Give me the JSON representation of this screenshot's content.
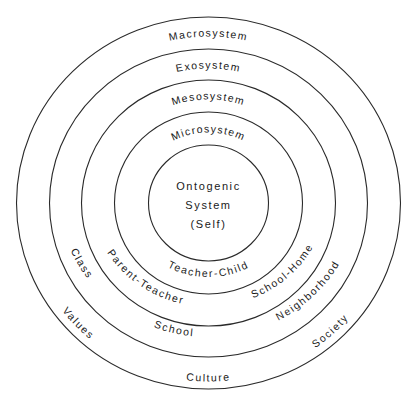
{
  "diagram": {
    "center": {
      "lines": [
        "Ontogenic",
        "System",
        "(Self)"
      ]
    },
    "rings": [
      {
        "name": "Microsystem",
        "examples": [
          "Teacher-Child"
        ]
      },
      {
        "name": "Mesosystem",
        "examples": [
          "Parent-Teacher",
          "School-Home"
        ]
      },
      {
        "name": "Exosystem",
        "examples": [
          "Class",
          "School",
          "Neighborhood"
        ]
      },
      {
        "name": "Macrosystem",
        "examples": [
          "Values",
          "Culture",
          "Society"
        ]
      }
    ],
    "colors": {
      "stroke": "#2a2a2a",
      "text": "#1a1a1a",
      "background": "#ffffff"
    }
  }
}
